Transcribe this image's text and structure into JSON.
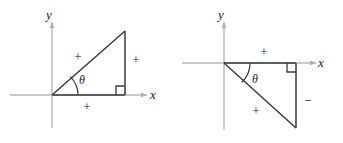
{
  "figure": {
    "background_color": "#ffffff",
    "axis_color": "#b8b8b8",
    "triangle_color": "#3a3a3a",
    "text_color": "#1a1a1a",
    "diagrams": [
      {
        "id": "left-diagram",
        "description": "Right triangle in first quadrant with angle theta at origin",
        "quadrant": "I",
        "axes": {
          "x_label": "x",
          "y_label": "y",
          "origin": {
            "x": 52,
            "y": 95
          },
          "x_axis": {
            "x1": 10,
            "y1": 95,
            "x2": 147,
            "y2": 95
          },
          "y_axis": {
            "x1": 52,
            "y1": 128,
            "x2": 52,
            "y2": 22
          },
          "x_label_pos": {
            "x": 150,
            "y": 97
          },
          "y_label_pos": {
            "x": 47,
            "y": 19
          }
        },
        "triangle": {
          "vertices": [
            {
              "x": 52,
              "y": 95
            },
            {
              "x": 125,
              "y": 95
            },
            {
              "x": 125,
              "y": 31
            }
          ]
        },
        "right_angle_marker": {
          "x": 116,
          "y": 86,
          "size": 9
        },
        "angle_arc": {
          "label": "θ",
          "label_pos": {
            "x": 79,
            "y": 83
          },
          "radius": 26
        },
        "signs": [
          {
            "name": "hypotenuse-sign",
            "text": "+",
            "x": 78,
            "y": 60
          },
          {
            "name": "vertical-leg-sign",
            "text": "+",
            "x": 135,
            "y": 62
          },
          {
            "name": "horizontal-leg-sign",
            "text": "+",
            "x": 85,
            "y": 109
          }
        ]
      },
      {
        "id": "right-diagram",
        "description": "Right triangle in fourth quadrant with angle theta at origin",
        "quadrant": "IV",
        "axes": {
          "x_label": "x",
          "y_label": "y",
          "origin": {
            "x": 224,
            "y": 63
          },
          "x_axis": {
            "x1": 182,
            "y1": 63,
            "x2": 316,
            "y2": 63
          },
          "y_axis": {
            "x1": 224,
            "y1": 130,
            "x2": 224,
            "y2": 22
          },
          "x_label_pos": {
            "x": 319,
            "y": 65
          },
          "y_label_pos": {
            "x": 219,
            "y": 19
          }
        },
        "triangle": {
          "vertices": [
            {
              "x": 224,
              "y": 63
            },
            {
              "x": 296,
              "y": 63
            },
            {
              "x": 296,
              "y": 128
            }
          ]
        },
        "right_angle_marker": {
          "x": 287,
          "y": 63,
          "size": 9
        },
        "angle_arc": {
          "label": "θ",
          "label_pos": {
            "x": 252,
            "y": 82
          },
          "radius": 26
        },
        "signs": [
          {
            "name": "horizontal-leg-sign",
            "text": "+",
            "x": 263,
            "y": 54
          },
          {
            "name": "vertical-leg-sign",
            "text": "−",
            "x": 306,
            "y": 103
          },
          {
            "name": "hypotenuse-sign",
            "text": "+",
            "x": 257,
            "y": 113
          }
        ]
      }
    ]
  }
}
